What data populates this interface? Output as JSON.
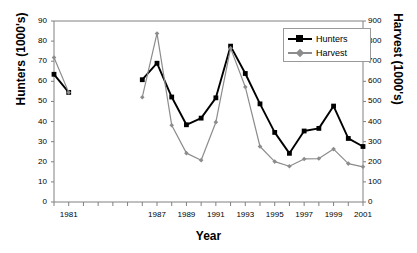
{
  "chart_data": {
    "type": "line",
    "title": "",
    "xlabel": "Year",
    "ylabel": "Hunters (1000's)",
    "y2label": "Harvest (1000's)",
    "ylim": [
      0,
      90
    ],
    "y2lim": [
      0,
      900
    ],
    "xlim": [
      1980,
      2001
    ],
    "grid": false,
    "legend_position": "top-right",
    "y_ticks": [
      0,
      10,
      20,
      30,
      40,
      50,
      60,
      70,
      80,
      90
    ],
    "y2_ticks": [
      0,
      100,
      200,
      300,
      400,
      500,
      600,
      700,
      800,
      900
    ],
    "x_tick_values": [
      1980,
      1981,
      1982,
      1983,
      1984,
      1985,
      1986,
      1987,
      1988,
      1989,
      1990,
      1991,
      1992,
      1993,
      1994,
      1995,
      1996,
      1997,
      1998,
      1999,
      2000,
      2001
    ],
    "x_tick_labels": [
      "",
      "1981",
      "",
      "",
      "",
      "",
      "",
      "1987",
      "",
      "1989",
      "",
      "1991",
      "",
      "1993",
      "",
      "1995",
      "",
      "1997",
      "",
      "1999",
      "",
      "2001"
    ],
    "series": [
      {
        "name": "Hunters",
        "axis": "left",
        "color": "#000000",
        "marker": "square",
        "x": [
          1980,
          1981,
          1986,
          1987,
          1988,
          1989,
          1990,
          1991,
          1992,
          1993,
          1994,
          1995,
          1996,
          1997,
          1998,
          1999,
          2000,
          2001
        ],
        "values": [
          63.5,
          54.5,
          60.8,
          69.0,
          52.2,
          38.4,
          41.7,
          51.8,
          77.5,
          63.9,
          48.8,
          34.6,
          24.2,
          35.3,
          36.6,
          47.7,
          31.6,
          27.6
        ],
        "gap_after_index": 1
      },
      {
        "name": "Harvest",
        "axis": "right",
        "color": "#8c8c8c",
        "marker": "diamond",
        "x": [
          1980,
          1981,
          1986,
          1987,
          1988,
          1989,
          1990,
          1991,
          1992,
          1993,
          1994,
          1995,
          1996,
          1997,
          1998,
          1999,
          2000,
          2001
        ],
        "values": [
          718,
          545,
          521,
          838,
          382,
          243,
          208,
          397,
          765,
          572,
          276,
          201,
          178,
          214,
          216,
          263,
          191,
          175
        ],
        "gap_after_index": 1
      }
    ]
  },
  "legend": {
    "items": [
      {
        "label": "Hunters"
      },
      {
        "label": "Harvest"
      }
    ]
  },
  "colors": {
    "hunters": "#000000",
    "harvest": "#8c8c8c",
    "axis": "#808080",
    "text": "#000000"
  }
}
